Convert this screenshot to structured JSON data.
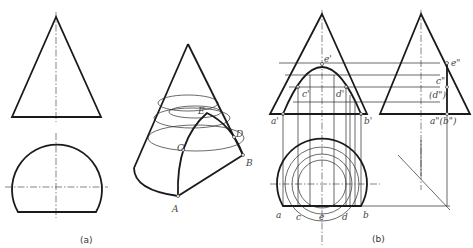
{
  "figure": {
    "captions": {
      "a": "(a)",
      "b": "(b)"
    },
    "iso_labels": {
      "A": "A",
      "B": "B",
      "C": "C",
      "D": "D",
      "E": "E"
    },
    "front_labels": {
      "a1": "a'",
      "b1": "b'",
      "c1": "c'",
      "d1": "d'",
      "e1": "e'"
    },
    "side_labels": {
      "e2": "e\"",
      "c2": "c\"",
      "d2": "(d\")",
      "ab2": "a\"(b\")"
    },
    "top_labels": {
      "a": "a",
      "c": "c",
      "e": "e",
      "d": "d",
      "b": "b"
    }
  }
}
